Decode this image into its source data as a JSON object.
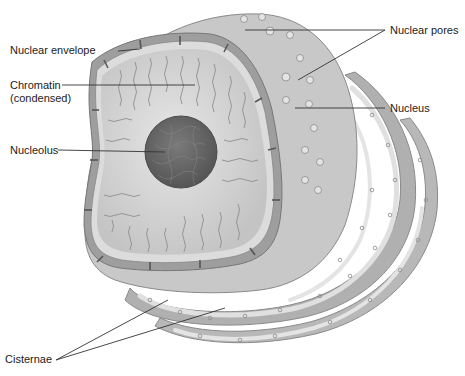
{
  "diagram": {
    "colors": {
      "background": "#ffffff",
      "membrane": "#bdbdbd",
      "membrane_dark": "#8a8a8a",
      "nucleoplasm": "#d9d9d9",
      "nucleolus": "#6e6e6e",
      "er_fill": "#b3b3b3",
      "er_lumen": "#e2e2e2",
      "label_text": "#222222",
      "leader_line": "#333333"
    },
    "labels": {
      "nuclear_envelope": "Nuclear envelope",
      "chromatin_line1": "Chromatin",
      "chromatin_line2": "(condensed)",
      "nucleolus": "Nucleolus",
      "nuclear_pores": "Nuclear pores",
      "nucleus": "Nucleus",
      "cisternae": "Cisternae"
    }
  }
}
